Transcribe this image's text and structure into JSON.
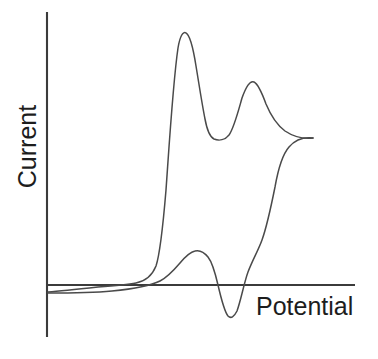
{
  "figure": {
    "kind": "cyclic-voltammogram",
    "background_color": "#ffffff",
    "trace_color": "#4a4a4a",
    "axis_color": "#3b3b3b"
  },
  "axes": {
    "y_label": "Current",
    "x_label": "Potential",
    "y_axis": {
      "x": 47,
      "y_top": 12,
      "y_bottom": 337
    },
    "x_axis": {
      "y": 285,
      "x_left": 47,
      "x_right": 355
    }
  },
  "chart_data": {
    "type": "line",
    "title": "",
    "subtitle": "",
    "xlabel": "Potential",
    "ylabel": "Current",
    "xlim": [
      0,
      1
    ],
    "ylim": [
      -1,
      1
    ],
    "grid": false,
    "legend": null,
    "ticks": {
      "x": [],
      "y": []
    },
    "annotations": [],
    "features": {
      "forward_peak_1": {
        "label": "anodic peak 1",
        "x_px": 181,
        "y_px": 34,
        "relative_height": 1.0
      },
      "forward_valley": {
        "label": "valley between anodic peaks",
        "x_px": 215,
        "y_px": 138,
        "relative_height": 0.59
      },
      "forward_peak_2": {
        "label": "anodic peak 2",
        "x_px": 250,
        "y_px": 82,
        "relative_height": 0.81
      },
      "switching_point": {
        "label": "scan reversal tip",
        "x_px": 313,
        "y_px": 138,
        "relative_height": 0.59
      },
      "reverse_bump": {
        "label": "reverse scan shoulder",
        "x_px": 195,
        "y_px": 252,
        "relative_height": 0.13
      },
      "reverse_trough": {
        "label": "cathodic peak",
        "x_px": 232,
        "y_px": 318,
        "relative_height": -0.13
      },
      "baseline_crossings_px": [
        123,
        217,
        247
      ]
    },
    "series": [
      {
        "name": "forward scan",
        "path": "M 48 292 C 70 290 95 287 118 285 C 133 284 144 284 152 277 C 160 268 163 234 167 178 C 171 116 175 52 181 35 C 186 22 192 30 196 48 C 200 68 203 96 206 118 C 209 132 212 139 217 140 C 226 141 232 140 236 131 C 240 119 244 99 249 84 C 253 77 258 79 262 91 C 267 105 272 119 280 127 C 290 135 303 137 313 138"
      },
      {
        "name": "reverse scan",
        "path": "M 313 138 C 303 139 292 142 286 152 C 279 164 275 183 272 201 C 267 228 262 248 254 253 C 246 256 238 254 232 253 C 224 252 212 251 203 251 C 195 251 188 255 183 262 C 176 271 168 280 158 284 C 146 288 128 289 110 290 C 90 291 66 292 48 293"
      },
      {
        "name": "reverse scan cathodic dip",
        "path": "M 254 253 C 248 256 241 254 234 253"
      }
    ]
  }
}
